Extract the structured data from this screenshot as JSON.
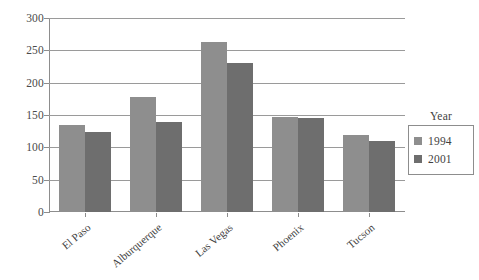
{
  "chart_data": {
    "type": "bar",
    "title": "",
    "subtitle": "",
    "xlabel": "",
    "ylabel": "",
    "ylim": [
      0,
      300
    ],
    "yticks": [
      0,
      50,
      100,
      150,
      200,
      250,
      300
    ],
    "grid": true,
    "legend_position": "right",
    "legend_title": "Year",
    "categories": [
      "El Paso",
      "Alburquerque",
      "Las Vegas",
      "Phoenix",
      "Tucson"
    ],
    "series": [
      {
        "name": "1994",
        "color": "#8e8e8e",
        "values": [
          135,
          178,
          263,
          147,
          119
        ]
      },
      {
        "name": "2001",
        "color": "#6e6e6e",
        "values": [
          124,
          139,
          231,
          146,
          110
        ]
      }
    ]
  }
}
